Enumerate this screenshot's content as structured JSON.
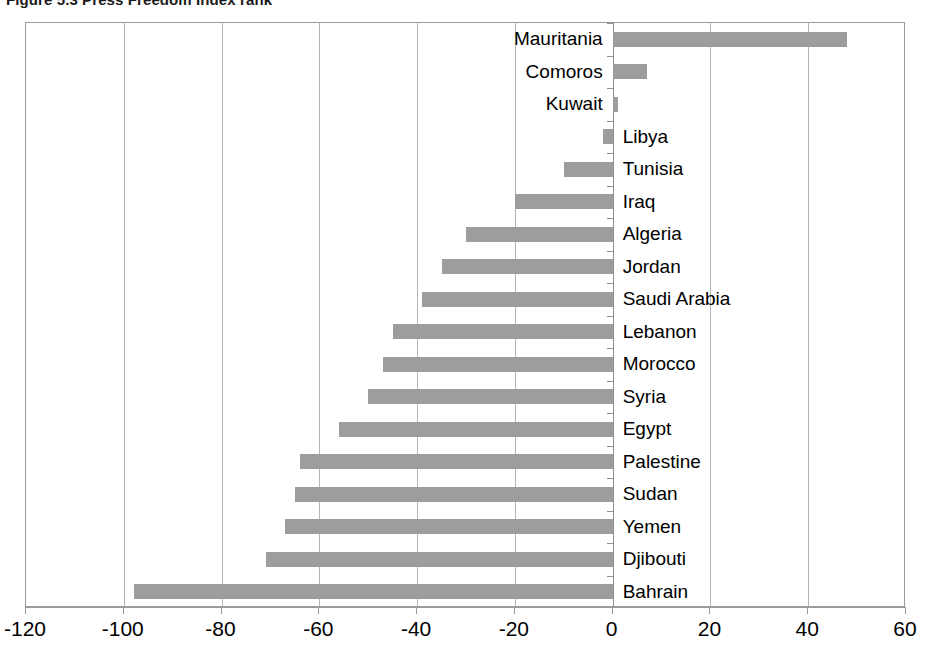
{
  "title": {
    "prefix": "Figure 5.3",
    "text": "Press Freedom Index rank",
    "full": "Figure 5.3 Press Freedom Index rank"
  },
  "colors": {
    "bar": "#9d9d9d",
    "grid": "#b5b5b5",
    "axis": "#9a9a9a",
    "text": "#000000",
    "background": "#ffffff"
  },
  "axis": {
    "x_ticks": [
      "-120",
      "-100",
      "-80",
      "-60",
      "-40",
      "-20",
      "0",
      "20",
      "40",
      "60"
    ]
  },
  "chart_data": {
    "type": "bar",
    "orientation": "horizontal",
    "title": "Figure 5.3 Press Freedom Index rank",
    "xlabel": "",
    "ylabel": "",
    "xlim": [
      -120,
      60
    ],
    "xticks": [
      -120,
      -100,
      -80,
      -60,
      -40,
      -20,
      0,
      20,
      40,
      60
    ],
    "grid": true,
    "legend": "none",
    "categories": [
      "Mauritania",
      "Comoros",
      "Kuwait",
      "Libya",
      "Tunisia",
      "Iraq",
      "Algeria",
      "Jordan",
      "Saudi Arabia",
      "Lebanon",
      "Morocco",
      "Syria",
      "Egypt",
      "Palestine",
      "Sudan",
      "Yemen",
      "Djibouti",
      "Bahrain"
    ],
    "values": [
      48,
      7,
      1,
      -2,
      -10,
      -20,
      -30,
      -35,
      -39,
      -45,
      -47,
      -50,
      -56,
      -64,
      -65,
      -67,
      -71,
      -98
    ],
    "bars": [
      {
        "label": "Mauritania",
        "value": 48,
        "label_side": "left"
      },
      {
        "label": "Comoros",
        "value": 7,
        "label_side": "left"
      },
      {
        "label": "Kuwait",
        "value": 1,
        "label_side": "left"
      },
      {
        "label": "Libya",
        "value": -2,
        "label_side": "right"
      },
      {
        "label": "Tunisia",
        "value": -10,
        "label_side": "right"
      },
      {
        "label": "Iraq",
        "value": -20,
        "label_side": "right"
      },
      {
        "label": "Algeria",
        "value": -30,
        "label_side": "right"
      },
      {
        "label": "Jordan",
        "value": -35,
        "label_side": "right"
      },
      {
        "label": "Saudi Arabia",
        "value": -39,
        "label_side": "right"
      },
      {
        "label": "Lebanon",
        "value": -45,
        "label_side": "right"
      },
      {
        "label": "Morocco",
        "value": -47,
        "label_side": "right"
      },
      {
        "label": "Syria",
        "value": -50,
        "label_side": "right"
      },
      {
        "label": "Egypt",
        "value": -56,
        "label_side": "right"
      },
      {
        "label": "Palestine",
        "value": -64,
        "label_side": "right"
      },
      {
        "label": "Sudan",
        "value": -65,
        "label_side": "right"
      },
      {
        "label": "Yemen",
        "value": -67,
        "label_side": "right"
      },
      {
        "label": "Djibouti",
        "value": -71,
        "label_side": "right"
      },
      {
        "label": "Bahrain",
        "value": -98,
        "label_side": "right"
      }
    ]
  }
}
